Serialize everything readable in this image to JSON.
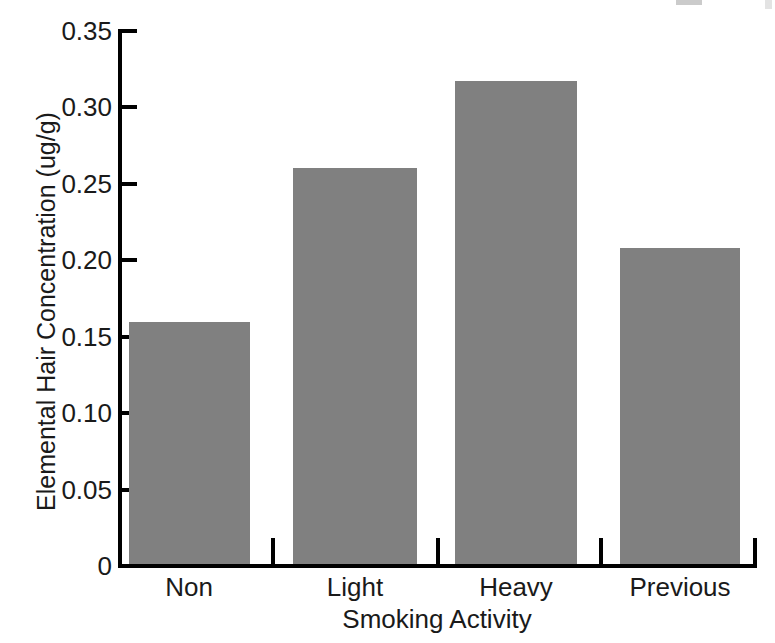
{
  "chart_data": {
    "type": "bar",
    "title": "",
    "categories": [
      "Non",
      "Light",
      "Heavy",
      "Previous"
    ],
    "values": [
      0.158,
      0.259,
      0.316,
      0.207
    ],
    "xlabel": "Smoking Activity",
    "ylabel": "Elemental Hair Concentration (ug/g)",
    "ylim": [
      0,
      0.35
    ],
    "yticks": [
      "0",
      "0.05",
      "0.10",
      "0.15",
      "0.20",
      "0.25",
      "0.30",
      "0.35"
    ],
    "ytick_values": [
      0,
      0.05,
      0.1,
      0.15,
      0.2,
      0.25,
      0.3,
      0.35
    ],
    "grid": false,
    "legend": false,
    "bar_color": "#808080",
    "axis_color": "#000000",
    "background": "#ffffff"
  }
}
